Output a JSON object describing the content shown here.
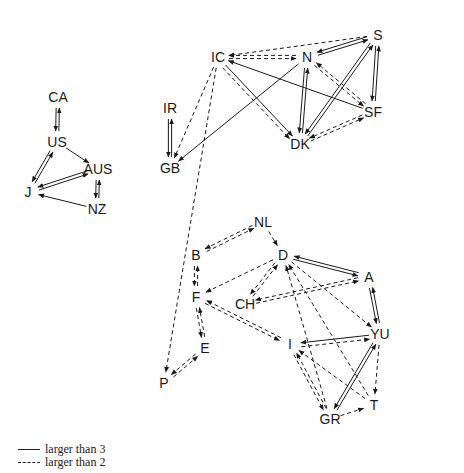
{
  "diagram": {
    "type": "directed-network",
    "nodes": [
      {
        "id": "CA",
        "x": 58,
        "y": 97
      },
      {
        "id": "US",
        "x": 57,
        "y": 142
      },
      {
        "id": "AUS",
        "x": 98,
        "y": 169
      },
      {
        "id": "J",
        "x": 28,
        "y": 192
      },
      {
        "id": "NZ",
        "x": 97,
        "y": 209
      },
      {
        "id": "IR",
        "x": 170,
        "y": 108
      },
      {
        "id": "GB",
        "x": 170,
        "y": 168
      },
      {
        "id": "IC",
        "x": 218,
        "y": 57
      },
      {
        "id": "N",
        "x": 307,
        "y": 57
      },
      {
        "id": "S",
        "x": 378,
        "y": 35
      },
      {
        "id": "SF",
        "x": 373,
        "y": 112
      },
      {
        "id": "DK",
        "x": 300,
        "y": 144
      },
      {
        "id": "NL",
        "x": 263,
        "y": 222
      },
      {
        "id": "B",
        "x": 196,
        "y": 255
      },
      {
        "id": "D",
        "x": 283,
        "y": 255
      },
      {
        "id": "F",
        "x": 196,
        "y": 297
      },
      {
        "id": "CH",
        "x": 245,
        "y": 304
      },
      {
        "id": "A",
        "x": 369,
        "y": 277
      },
      {
        "id": "E",
        "x": 205,
        "y": 348
      },
      {
        "id": "I",
        "x": 290,
        "y": 344
      },
      {
        "id": "YU",
        "x": 380,
        "y": 334
      },
      {
        "id": "P",
        "x": 164,
        "y": 383
      },
      {
        "id": "T",
        "x": 374,
        "y": 405
      },
      {
        "id": "GR",
        "x": 330,
        "y": 419
      }
    ],
    "edges": [
      {
        "from": "US",
        "to": "CA",
        "style": "solid",
        "bidir": true
      },
      {
        "from": "US",
        "to": "AUS",
        "style": "solid",
        "bidir": false
      },
      {
        "from": "US",
        "to": "J",
        "style": "solid",
        "bidir": true
      },
      {
        "from": "AUS",
        "to": "J",
        "style": "solid",
        "bidir": true
      },
      {
        "from": "AUS",
        "to": "NZ",
        "style": "solid",
        "bidir": true
      },
      {
        "from": "NZ",
        "to": "J",
        "style": "solid",
        "bidir": false
      },
      {
        "from": "GB",
        "to": "IR",
        "style": "solid",
        "bidir": true
      },
      {
        "from": "IC",
        "to": "GB",
        "style": "dashed",
        "bidir": false
      },
      {
        "from": "N",
        "to": "GB",
        "style": "solid",
        "bidir": false
      },
      {
        "from": "IC",
        "to": "P",
        "style": "dashed",
        "bidir": false
      },
      {
        "from": "S",
        "to": "IC",
        "style": "dashed",
        "bidir": false
      },
      {
        "from": "IC",
        "to": "N",
        "style": "dashed",
        "bidir": true
      },
      {
        "from": "S",
        "to": "N",
        "style": "solid",
        "bidir": true
      },
      {
        "from": "S",
        "to": "SF",
        "style": "solid",
        "bidir": true
      },
      {
        "from": "S",
        "to": "DK",
        "style": "solid",
        "bidir": true
      },
      {
        "from": "N",
        "to": "DK",
        "style": "solid",
        "bidir": true
      },
      {
        "from": "N",
        "to": "SF",
        "style": "dashed",
        "bidir": true
      },
      {
        "from": "SF",
        "to": "IC",
        "style": "solid",
        "bidir": false
      },
      {
        "from": "SF",
        "to": "DK",
        "style": "dashed",
        "bidir": true
      },
      {
        "from": "IC",
        "to": "DK",
        "style": "solid",
        "bidir": false
      },
      {
        "from": "IC",
        "to": "DK",
        "style": "dashed",
        "bidir": false,
        "offset": 4
      },
      {
        "from": "NL",
        "to": "B",
        "style": "dashed",
        "bidir": true
      },
      {
        "from": "NL",
        "to": "D",
        "style": "dashed",
        "bidir": false
      },
      {
        "from": "B",
        "to": "F",
        "style": "dashed",
        "bidir": true
      },
      {
        "from": "F",
        "to": "E",
        "style": "dashed",
        "bidir": true
      },
      {
        "from": "P",
        "to": "E",
        "style": "dashed",
        "bidir": true
      },
      {
        "from": "D",
        "to": "F",
        "style": "dashed",
        "bidir": false
      },
      {
        "from": "D",
        "to": "CH",
        "style": "dashed",
        "bidir": true
      },
      {
        "from": "D",
        "to": "A",
        "style": "solid",
        "bidir": true
      },
      {
        "from": "A",
        "to": "CH",
        "style": "dashed",
        "bidir": true
      },
      {
        "from": "A",
        "to": "YU",
        "style": "solid",
        "bidir": true
      },
      {
        "from": "D",
        "to": "YU",
        "style": "dashed",
        "bidir": false
      },
      {
        "from": "F",
        "to": "I",
        "style": "dashed",
        "bidir": true
      },
      {
        "from": "YU",
        "to": "I",
        "style": "solid",
        "bidir": false
      },
      {
        "from": "I",
        "to": "YU",
        "style": "dashed",
        "bidir": false,
        "offset": 4
      },
      {
        "from": "T",
        "to": "I",
        "style": "dashed",
        "bidir": false
      },
      {
        "from": "I",
        "to": "GR",
        "style": "dashed",
        "bidir": true
      },
      {
        "from": "GR",
        "to": "YU",
        "style": "solid",
        "bidir": true
      },
      {
        "from": "YU",
        "to": "T",
        "style": "dashed",
        "bidir": false
      },
      {
        "from": "GR",
        "to": "T",
        "style": "dashed",
        "bidir": false
      },
      {
        "from": "GR",
        "to": "D",
        "style": "dashed",
        "bidir": false
      },
      {
        "from": "T",
        "to": "D",
        "style": "dashed",
        "bidir": false
      }
    ]
  },
  "legend": {
    "items": [
      {
        "style": "solid",
        "label": "larger than 3"
      },
      {
        "style": "dashed",
        "label": "larger than 2"
      }
    ]
  }
}
